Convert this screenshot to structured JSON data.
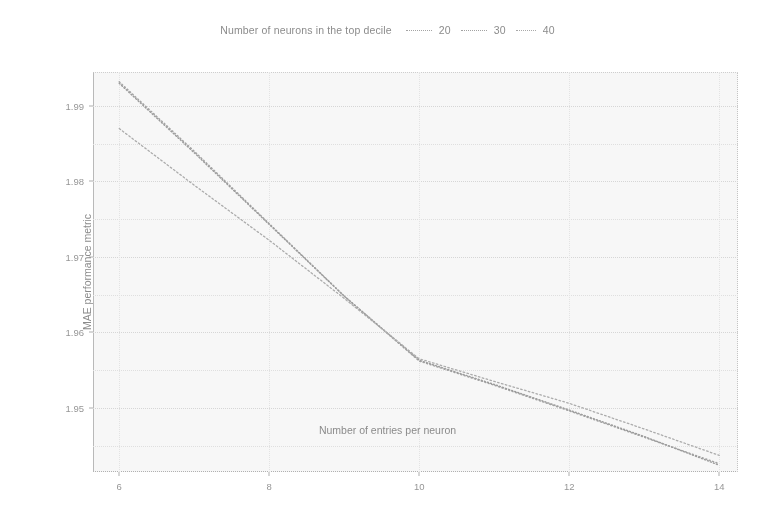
{
  "legend": {
    "title": "Number of neurons in the top decile",
    "entries": [
      {
        "label": "20",
        "dash": "1,2.6",
        "color": "#8d8d8d",
        "width": 1.45
      },
      {
        "label": "30",
        "dash": "1,2.2",
        "color": "#828282",
        "width": 1.45
      },
      {
        "label": "40",
        "dash": "1.6,2.4",
        "color": "#979797",
        "width": 1.3
      }
    ]
  },
  "axes": {
    "xlabel": "Number of entries per neuron",
    "ylabel": "MAE performance metric",
    "xticks": [
      "6",
      "8",
      "10",
      "12",
      "14"
    ],
    "yticks": [
      "1.99",
      "1.98",
      "1.97",
      "1.96",
      "1.95"
    ]
  },
  "chart_data": {
    "type": "line",
    "title": "",
    "subtitle": "",
    "xlabel": "Number of entries per neuron",
    "ylabel": "MAE performance metric",
    "legend_title": "Number of neurons in the top decile",
    "legend_position": "top-center",
    "grid": true,
    "xlim": [
      5.65,
      14.25
    ],
    "ylim": [
      1.9415,
      1.9945
    ],
    "xticks": [
      6,
      8,
      10,
      12,
      14
    ],
    "yticks": [
      1.99,
      1.98,
      1.97,
      1.96,
      1.95
    ],
    "x": [
      6,
      7,
      8,
      9,
      10,
      11,
      12,
      13,
      14
    ],
    "series": [
      {
        "name": "20",
        "values": [
          1.9932,
          1.984,
          1.9744,
          1.9648,
          1.9562,
          1.953,
          1.9496,
          1.9461,
          1.9426
        ]
      },
      {
        "name": "30",
        "values": [
          1.993,
          1.9838,
          1.9743,
          1.9648,
          1.9563,
          1.9531,
          1.9497,
          1.9462,
          1.9424
        ]
      },
      {
        "name": "40",
        "values": [
          1.987,
          1.9795,
          1.9722,
          1.9645,
          1.9565,
          1.9535,
          1.9506,
          1.9472,
          1.9437
        ]
      }
    ],
    "annotations": [
      {
        "text": "slope change (kink) near x = 10",
        "x": 10,
        "y": 1.9563
      }
    ]
  }
}
